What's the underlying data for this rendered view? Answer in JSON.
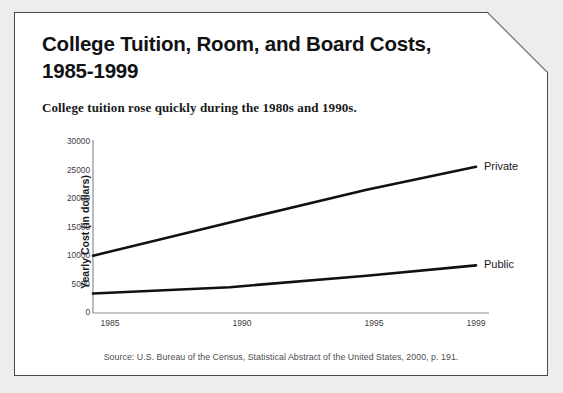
{
  "page": {
    "background_color": "#eceded",
    "card_color": "#ffffff",
    "border_color": "#4a4a4c"
  },
  "title": "College Tuition, Room, and Board Costs, 1985-1999",
  "title_line1": "College Tuition, Room, and Board Costs,",
  "title_line2": "1985-1999",
  "subtitle": "College tuition rose quickly during the 1980s and 1990s.",
  "source": "Source: U.S. Bureau of the Census, Statistical Abstract of the United States, 2000, p. 191.",
  "chart_data": {
    "type": "line",
    "title": "College Tuition, Room, and Board Costs, 1985-1999",
    "subtitle": "College tuition rose quickly during the 1980s and 1990s.",
    "xlabel": "",
    "ylabel": "Yearly Cost (in dollars)",
    "x": [
      1985,
      1990,
      1995,
      1999
    ],
    "xticklabels": [
      "1985",
      "1990",
      "1995",
      "1999"
    ],
    "yticks": [
      0,
      5000,
      10000,
      15000,
      20000,
      25000,
      30000
    ],
    "yticklabels": [
      "0",
      "5000",
      "10000",
      "15000",
      "20000",
      "25000",
      "30000"
    ],
    "ylim": [
      0,
      30000
    ],
    "xlim": [
      1985,
      1999
    ],
    "grid": false,
    "legend_position": "inline-right-of-line",
    "line_color": "#111111",
    "series": [
      {
        "name": "Private",
        "label": "Private",
        "values": [
          10000,
          15800,
          21500,
          25500
        ]
      },
      {
        "name": "Public",
        "label": "Public",
        "values": [
          3400,
          4500,
          6500,
          8300
        ]
      }
    ]
  }
}
